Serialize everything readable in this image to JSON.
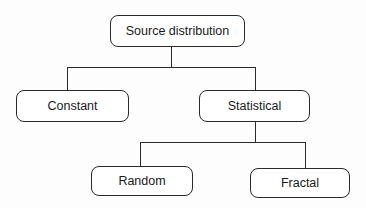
{
  "diagram": {
    "type": "tree",
    "colors": {
      "stroke": "#2a2a2a",
      "text": "#1a1a1a",
      "background": "#ffffff"
    },
    "nodes": {
      "root": {
        "label": "Source distribution"
      },
      "constant": {
        "label": "Constant"
      },
      "statistical": {
        "label": "Statistical"
      },
      "random": {
        "label": "Random"
      },
      "fractal": {
        "label": "Fractal"
      }
    },
    "edges": [
      {
        "from": "root",
        "to": "constant"
      },
      {
        "from": "root",
        "to": "statistical"
      },
      {
        "from": "statistical",
        "to": "random"
      },
      {
        "from": "statistical",
        "to": "fractal"
      }
    ]
  }
}
